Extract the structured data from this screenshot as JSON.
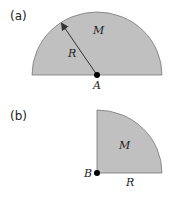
{
  "figure_a": {
    "label": "(a)",
    "mass_label": "M",
    "radius_label": "R",
    "point_label": "A"
  },
  "figure_b": {
    "label": "(b)",
    "mass_label": "M",
    "radius_label": "R",
    "point_label": "B"
  },
  "colors": {
    "fill": "#c0c0c0",
    "stroke": "#666666",
    "point": "#000000"
  }
}
